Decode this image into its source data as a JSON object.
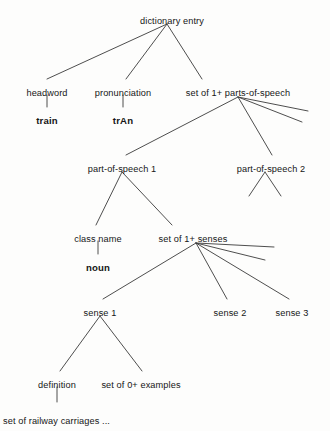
{
  "diagram": {
    "type": "tree",
    "line_color": "#3a3a3a",
    "text_color": "#161616",
    "background": "#fdfdfc",
    "nodes": [
      {
        "id": "dictionary-entry",
        "label": "dictionary entry",
        "x": 172,
        "y": 16,
        "bold": false,
        "align": "center"
      },
      {
        "id": "headword",
        "label": "headword",
        "x": 47,
        "y": 88,
        "bold": false,
        "align": "center"
      },
      {
        "id": "headword-value",
        "label": "train",
        "x": 47,
        "y": 115,
        "bold": true,
        "align": "center"
      },
      {
        "id": "pronunciation",
        "label": "pronunciation",
        "x": 123,
        "y": 88,
        "bold": false,
        "align": "center"
      },
      {
        "id": "pronunciation-value",
        "label": "trAn",
        "x": 123,
        "y": 115,
        "bold": true,
        "align": "center"
      },
      {
        "id": "set-parts-of-speech",
        "label": "set of 1+ parts-of-speech",
        "x": 238,
        "y": 88,
        "bold": false,
        "align": "center"
      },
      {
        "id": "part-of-speech-1",
        "label": "part-of-speech 1",
        "x": 122,
        "y": 164,
        "bold": false,
        "align": "center"
      },
      {
        "id": "part-of-speech-2",
        "label": "part-of-speech 2",
        "x": 271,
        "y": 164,
        "bold": false,
        "align": "center"
      },
      {
        "id": "class-name",
        "label": "class name",
        "x": 98,
        "y": 234,
        "bold": false,
        "align": "center"
      },
      {
        "id": "class-name-value",
        "label": "noun",
        "x": 98,
        "y": 262,
        "bold": true,
        "align": "center"
      },
      {
        "id": "set-senses",
        "label": "set of 1+ senses",
        "x": 193,
        "y": 234,
        "bold": false,
        "align": "center"
      },
      {
        "id": "sense-1",
        "label": "sense 1",
        "x": 100,
        "y": 308,
        "bold": false,
        "align": "center"
      },
      {
        "id": "sense-2",
        "label": "sense 2",
        "x": 230,
        "y": 308,
        "bold": false,
        "align": "center"
      },
      {
        "id": "sense-3",
        "label": "sense 3",
        "x": 292,
        "y": 308,
        "bold": false,
        "align": "center"
      },
      {
        "id": "definition",
        "label": "definition",
        "x": 57,
        "y": 380,
        "bold": false,
        "align": "center"
      },
      {
        "id": "set-examples",
        "label": "set of 0+ examples",
        "x": 141,
        "y": 380,
        "bold": false,
        "align": "center"
      },
      {
        "id": "definition-value",
        "label": "set of railway carriages ...",
        "x": 3,
        "y": 416,
        "bold": false,
        "align": "left"
      }
    ],
    "edges": [
      {
        "id": "entry-to-headword",
        "from": "dictionary-entry",
        "to": "headword",
        "x1": 167,
        "y1": 24,
        "x2": 47,
        "y2": 79
      },
      {
        "id": "entry-to-pronunciation",
        "from": "dictionary-entry",
        "to": "pronunciation",
        "x1": 167,
        "y1": 24,
        "x2": 126,
        "y2": 79
      },
      {
        "id": "entry-to-parts",
        "from": "dictionary-entry",
        "to": "set-parts-of-speech",
        "x1": 167,
        "y1": 24,
        "x2": 202,
        "y2": 79
      },
      {
        "id": "headword-stem",
        "from": "headword",
        "to": "headword-value",
        "x1": 47,
        "y1": 95,
        "x2": 47,
        "y2": 107
      },
      {
        "id": "pronunciation-stem",
        "from": "pronunciation",
        "to": "pronunciation-value",
        "x1": 123,
        "y1": 95,
        "x2": 123,
        "y2": 107
      },
      {
        "id": "parts-to-pos1",
        "from": "set-parts-of-speech",
        "to": "part-of-speech-1",
        "x1": 238,
        "y1": 97,
        "x2": 126,
        "y2": 155
      },
      {
        "id": "parts-to-pos2",
        "from": "set-parts-of-speech",
        "to": "part-of-speech-2",
        "x1": 238,
        "y1": 97,
        "x2": 272,
        "y2": 155
      },
      {
        "id": "parts-stub-a",
        "from": "set-parts-of-speech",
        "to": "",
        "x1": 238,
        "y1": 97,
        "x2": 308,
        "y2": 111
      },
      {
        "id": "parts-stub-b",
        "from": "set-parts-of-speech",
        "to": "",
        "x1": 238,
        "y1": 97,
        "x2": 302,
        "y2": 122
      },
      {
        "id": "pos2-branch-left",
        "from": "part-of-speech-2",
        "to": "",
        "x1": 265,
        "y1": 172,
        "x2": 249,
        "y2": 196
      },
      {
        "id": "pos2-branch-right",
        "from": "part-of-speech-2",
        "to": "",
        "x1": 265,
        "y1": 172,
        "x2": 281,
        "y2": 196
      },
      {
        "id": "pos1-to-class-name",
        "from": "part-of-speech-1",
        "to": "class-name",
        "x1": 122,
        "y1": 172,
        "x2": 96,
        "y2": 225
      },
      {
        "id": "pos1-to-senses",
        "from": "part-of-speech-1",
        "to": "set-senses",
        "x1": 122,
        "y1": 172,
        "x2": 172,
        "y2": 225
      },
      {
        "id": "class-name-stem",
        "from": "class-name",
        "to": "class-name-value",
        "x1": 98,
        "y1": 241,
        "x2": 98,
        "y2": 254
      },
      {
        "id": "senses-to-sense1",
        "from": "set-senses",
        "to": "sense-1",
        "x1": 196,
        "y1": 243,
        "x2": 103,
        "y2": 299
      },
      {
        "id": "senses-to-sense2",
        "from": "set-senses",
        "to": "sense-2",
        "x1": 196,
        "y1": 243,
        "x2": 227,
        "y2": 299
      },
      {
        "id": "senses-to-sense3",
        "from": "set-senses",
        "to": "sense-3",
        "x1": 196,
        "y1": 243,
        "x2": 289,
        "y2": 299
      },
      {
        "id": "senses-stub-a",
        "from": "set-senses",
        "to": "",
        "x1": 196,
        "y1": 243,
        "x2": 274,
        "y2": 247
      },
      {
        "id": "senses-stub-b",
        "from": "set-senses",
        "to": "",
        "x1": 196,
        "y1": 243,
        "x2": 265,
        "y2": 260
      },
      {
        "id": "sense1-to-definition",
        "from": "sense-1",
        "to": "definition",
        "x1": 100,
        "y1": 316,
        "x2": 60,
        "y2": 371
      },
      {
        "id": "sense1-to-examples",
        "from": "sense-1",
        "to": "set-examples",
        "x1": 100,
        "y1": 316,
        "x2": 142,
        "y2": 371
      },
      {
        "id": "definition-stem",
        "from": "definition",
        "to": "definition-value",
        "x1": 57,
        "y1": 387,
        "x2": 57,
        "y2": 402
      }
    ]
  }
}
